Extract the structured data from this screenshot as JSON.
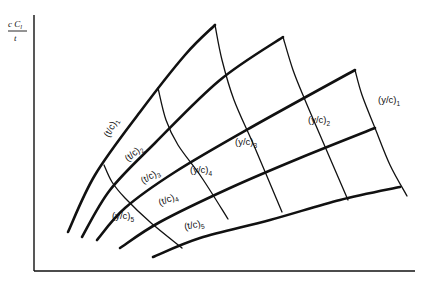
{
  "chart_data": {
    "type": "line",
    "title": "",
    "xlabel": "",
    "ylabel": "c C_l / t",
    "ylabel_parts": {
      "numerator": "c C",
      "sub": "l",
      "denominator": "t"
    },
    "grid": false,
    "series_tc": [
      {
        "name": "(t/c)1",
        "base": "(t/c)",
        "sub": "1",
        "points": [
          [
            68,
            232
          ],
          [
            95,
            175
          ],
          [
            140,
            112
          ],
          [
            185,
            55
          ],
          [
            215,
            25
          ]
        ]
      },
      {
        "name": "(t/c)2",
        "base": "(t/c)",
        "sub": "2",
        "points": [
          [
            82,
            237
          ],
          [
            110,
            190
          ],
          [
            155,
            143
          ],
          [
            220,
            80
          ],
          [
            283,
            37
          ]
        ]
      },
      {
        "name": "(t/c)3",
        "base": "(t/c)",
        "sub": "3",
        "points": [
          [
            97,
            240
          ],
          [
            125,
            208
          ],
          [
            175,
            172
          ],
          [
            250,
            128
          ],
          [
            355,
            70
          ]
        ]
      },
      {
        "name": "(t/c)4",
        "base": "(t/c)",
        "sub": "4",
        "points": [
          [
            120,
            248
          ],
          [
            160,
            222
          ],
          [
            230,
            188
          ],
          [
            300,
            158
          ],
          [
            375,
            128
          ]
        ]
      },
      {
        "name": "(t/c)5",
        "base": "(t/c)",
        "sub": "5",
        "points": [
          [
            153,
            257
          ],
          [
            200,
            238
          ],
          [
            270,
            220
          ],
          [
            340,
            200
          ],
          [
            400,
            187
          ]
        ]
      }
    ],
    "series_yc": [
      {
        "name": "(y/c)1",
        "base": "(y/c)",
        "sub": "1",
        "points": [
          [
            355,
            70
          ],
          [
            362,
            95
          ],
          [
            375,
            128
          ],
          [
            390,
            165
          ],
          [
            407,
            196
          ]
        ]
      },
      {
        "name": "(y/c)2",
        "base": "(y/c)",
        "sub": "2",
        "points": [
          [
            283,
            37
          ],
          [
            293,
            70
          ],
          [
            305,
            100
          ],
          [
            320,
            135
          ],
          [
            348,
            200
          ]
        ]
      },
      {
        "name": "(y/c)3",
        "base": "(y/c)",
        "sub": "3",
        "points": [
          [
            215,
            25
          ],
          [
            222,
            60
          ],
          [
            234,
            100
          ],
          [
            255,
            148
          ],
          [
            282,
            212
          ]
        ]
      },
      {
        "name": "(y/c)4",
        "base": "(y/c)",
        "sub": "4",
        "points": [
          [
            158,
            88
          ],
          [
            166,
            120
          ],
          [
            178,
            145
          ],
          [
            202,
            178
          ],
          [
            228,
            219
          ]
        ]
      },
      {
        "name": "(y/c)5",
        "base": "(y/c)",
        "sub": "5",
        "points": [
          [
            104,
            165
          ],
          [
            112,
            182
          ],
          [
            125,
            198
          ],
          [
            150,
            222
          ],
          [
            182,
            248
          ]
        ]
      }
    ],
    "labels": [
      {
        "text": "(t/c)",
        "sub": "1",
        "x": 109,
        "y": 138,
        "rot": -62
      },
      {
        "text": "(t/c)",
        "sub": "2",
        "x": 128,
        "y": 162,
        "rot": -40
      },
      {
        "text": "(t/c)",
        "sub": "3",
        "x": 143,
        "y": 184,
        "rot": -30
      },
      {
        "text": "(t/c)",
        "sub": "4",
        "x": 160,
        "y": 206,
        "rot": -22
      },
      {
        "text": "(t/c)",
        "sub": "5",
        "x": 185,
        "y": 230,
        "rot": -12
      },
      {
        "text": "(y/c)",
        "sub": "1",
        "x": 378,
        "y": 103,
        "rot": 0
      },
      {
        "text": "(y/c)",
        "sub": "2",
        "x": 308,
        "y": 123,
        "rot": 0
      },
      {
        "text": "(y/c)",
        "sub": "3",
        "x": 235,
        "y": 145,
        "rot": 0
      },
      {
        "text": "(y/c)",
        "sub": "4",
        "x": 190,
        "y": 173,
        "rot": 0
      },
      {
        "text": "(y/c)",
        "sub": "5",
        "x": 112,
        "y": 219,
        "rot": 0
      }
    ]
  }
}
